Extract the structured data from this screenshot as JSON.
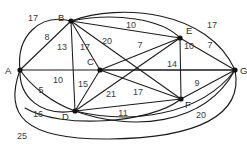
{
  "figure": {
    "kind": "weighted-undirected-graph",
    "title": "",
    "background_color": "#ffffff",
    "line_color": "#1c1c1c",
    "label_color": "#3a3a3a",
    "width": 247,
    "height": 144
  },
  "vertices": [
    {
      "id": "A",
      "label": "A",
      "x": 20,
      "y": 70,
      "label_x": 8,
      "label_y": 71
    },
    {
      "id": "B",
      "label": "B",
      "x": 71,
      "y": 21,
      "label_x": 61,
      "label_y": 18
    },
    {
      "id": "C",
      "label": "C",
      "x": 100,
      "y": 70,
      "label_x": 90,
      "label_y": 62
    },
    {
      "id": "D",
      "label": "D",
      "x": 75,
      "y": 111,
      "label_x": 65,
      "label_y": 117
    },
    {
      "id": "E",
      "label": "E",
      "x": 180,
      "y": 38,
      "label_x": 188,
      "label_y": 31
    },
    {
      "id": "F",
      "label": "F",
      "x": 181,
      "y": 99,
      "label_x": 187,
      "label_y": 105
    },
    {
      "id": "G",
      "label": "G",
      "x": 235,
      "y": 70,
      "label_x": 241,
      "label_y": 71
    }
  ],
  "edges": [
    {
      "from": "A",
      "to": "B",
      "weight": "8",
      "label_x": 47,
      "label_y": 38,
      "shape": "straight"
    },
    {
      "from": "A",
      "to": "C",
      "weight": "10",
      "label_x": 58,
      "label_y": 81,
      "shape": "straight"
    },
    {
      "from": "A",
      "to": "D",
      "weight": "5",
      "label_x": 41,
      "label_y": 91,
      "shape": "curve"
    },
    {
      "from": "A",
      "to": "B",
      "weight": "17",
      "label_x": 33,
      "label_y": 19,
      "shape": "arc-top"
    },
    {
      "from": "A",
      "to": "D",
      "weight": "16",
      "label_x": 38,
      "label_y": 115,
      "shape": "arc-bottom"
    },
    {
      "from": "A",
      "to": "G",
      "weight": "25",
      "label_x": 22,
      "label_y": 137,
      "shape": "arc-bottom-outer"
    },
    {
      "from": "B",
      "to": "C",
      "weight": "13",
      "label_x": 62,
      "label_y": 48,
      "shape": "straight"
    },
    {
      "from": "B",
      "to": "D",
      "weight": "17",
      "label_x": 85,
      "label_y": 48,
      "shape": "straight"
    },
    {
      "from": "B",
      "to": "F",
      "weight": "20",
      "label_x": 107,
      "label_y": 42,
      "shape": "straight"
    },
    {
      "from": "B",
      "to": "E",
      "weight": "10",
      "label_x": 131,
      "label_y": 26,
      "shape": "straight"
    },
    {
      "from": "B",
      "to": "G",
      "weight": "17",
      "label_x": 212,
      "label_y": 26,
      "shape": "arc-top"
    },
    {
      "from": "C",
      "to": "D",
      "weight": "15",
      "label_x": 83,
      "label_y": 85,
      "shape": "straight"
    },
    {
      "from": "C",
      "to": "E",
      "weight": "7",
      "label_x": 140,
      "label_y": 46,
      "shape": "straight"
    },
    {
      "from": "C",
      "to": "F",
      "weight": "17",
      "label_x": 138,
      "label_y": 93,
      "shape": "straight"
    },
    {
      "from": "C",
      "to": "G",
      "weight": "14",
      "label_x": 172,
      "label_y": 65,
      "shape": "straight"
    },
    {
      "from": "D",
      "to": "E",
      "weight": "21",
      "label_x": 111,
      "label_y": 95,
      "shape": "straight"
    },
    {
      "from": "D",
      "to": "F",
      "weight": "11",
      "label_x": 123,
      "label_y": 114,
      "shape": "straight"
    },
    {
      "from": "D",
      "to": "G",
      "weight": "20",
      "label_x": 201,
      "label_y": 116,
      "shape": "arc-bottom"
    },
    {
      "from": "E",
      "to": "F",
      "weight": "10",
      "label_x": 188,
      "label_y": 47,
      "shape": "straight"
    },
    {
      "from": "E",
      "to": "G",
      "weight": "7",
      "label_x": 210,
      "label_y": 46,
      "shape": "straight"
    },
    {
      "from": "F",
      "to": "G",
      "weight": "9",
      "label_x": 197,
      "label_y": 84,
      "shape": "straight"
    }
  ],
  "weight_labels": [
    "17",
    "8",
    "13",
    "17",
    "20",
    "10",
    "17",
    "7",
    "10",
    "7",
    "10",
    "14",
    "15",
    "5",
    "21",
    "17",
    "9",
    "16",
    "11",
    "20",
    "25"
  ]
}
